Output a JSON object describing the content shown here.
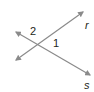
{
  "diagram": {
    "type": "intersecting-lines",
    "colors": {
      "line": "#8a8a8a",
      "arrow": "#8a8a8a",
      "text": "#231f20"
    },
    "lines": [
      {
        "name": "r",
        "label": "r",
        "from": [
          16,
          60
        ],
        "to": [
          83,
          12
        ]
      },
      {
        "name": "s",
        "label": "s",
        "from": [
          16,
          32
        ],
        "to": [
          90,
          75
        ]
      }
    ],
    "angles": [
      {
        "label": "2",
        "position": "above intersection, left"
      },
      {
        "label": "1",
        "position": "right of intersection"
      }
    ]
  }
}
